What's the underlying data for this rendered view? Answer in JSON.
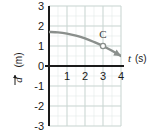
{
  "figure": {
    "name": "position-time-graph",
    "background": "#ffffff"
  },
  "chart_data": {
    "type": "line",
    "title": "",
    "xlabel": "t (s)",
    "ylabel": "d (m)",
    "xlabel_symbol": "t",
    "xlabel_unit": "(s)",
    "ylabel_symbol": "d",
    "ylabel_unit": "(m)",
    "ylabel_has_vector_arrow": true,
    "xlim": [
      0,
      4
    ],
    "ylim": [
      -3,
      3
    ],
    "x_ticks": [
      1,
      2,
      3,
      4
    ],
    "x_tick_labels": [
      "1",
      "2",
      "3",
      "4"
    ],
    "y_ticks": [
      3,
      2,
      1,
      0,
      -1,
      -2,
      -3
    ],
    "y_tick_labels": [
      "3",
      "2",
      "1",
      "0",
      "-1",
      "-2",
      "-3"
    ],
    "grid": true,
    "grid_major": true,
    "grid_minor": true,
    "grid_minor_subdivisions": 2,
    "grid_color": "#c9d6d2",
    "grid_minor_color": "#e2eae8",
    "axis_color": "#1a1a1a",
    "legend": null,
    "series": [
      {
        "name": "position curve",
        "color": "#8a8f8c",
        "has_arrowhead_end": true,
        "x": [
          0,
          0.5,
          1,
          1.5,
          2,
          2.5,
          3,
          3.5,
          4
        ],
        "y": [
          1.7,
          1.68,
          1.62,
          1.52,
          1.38,
          1.2,
          1.0,
          0.76,
          0.5
        ]
      }
    ],
    "annotations": [
      {
        "label": "C",
        "marker": "open-circle",
        "marker_color": "#8a8f8c",
        "x": 3,
        "y": 1.0,
        "label_offset": "above"
      }
    ]
  }
}
